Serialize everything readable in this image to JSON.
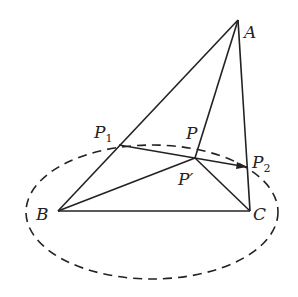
{
  "points": {
    "A": {
      "label": "A",
      "x": 238,
      "y": 20
    },
    "B": {
      "label": "B",
      "x": 58,
      "y": 211
    },
    "C": {
      "label": "C",
      "x": 250,
      "y": 211
    },
    "P": {
      "label": "P",
      "x": 198,
      "y": 143
    },
    "P_prime": {
      "label": "P′",
      "x": 195,
      "y": 158
    },
    "P1": {
      "label": "P",
      "sub": "1",
      "x": 119,
      "y": 145
    },
    "P2": {
      "label": "P",
      "sub": "2",
      "x": 247,
      "y": 167
    }
  },
  "ellipse": {
    "cx": 152,
    "cy": 212,
    "rx": 126,
    "ry": 67,
    "style": "dashed"
  },
  "colors": {
    "stroke": "#222222",
    "background": "#ffffff"
  }
}
